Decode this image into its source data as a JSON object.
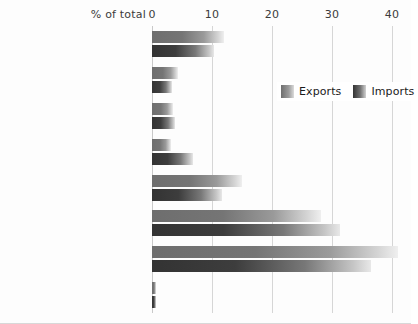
{
  "chart_data": {
    "type": "bar",
    "orientation": "horizontal",
    "title": "",
    "xlabel": "% of total",
    "ylabel": "",
    "xlim": [
      0,
      40
    ],
    "xticks": [
      0,
      10,
      20,
      30,
      40
    ],
    "xtick_labels": [
      "0",
      "10",
      "20",
      "30",
      "40"
    ],
    "grid": true,
    "legend_position": "upper right",
    "categories": [
      "Food/live animals",
      "Alcohol/tobacco",
      "Raw materials (ores etc.)",
      "Fuels/energy",
      "Chemicals",
      "Manufactured goods",
      "Machinery/transport equipment",
      "Other goods and services"
    ],
    "series": [
      {
        "name": "Exports",
        "color": "#6e6e6e",
        "values": [
          12.0,
          4.3,
          3.5,
          3.2,
          15.0,
          28.2,
          41.0,
          0.7
        ]
      },
      {
        "name": "Imports",
        "color": "#333333",
        "values": [
          10.4,
          3.3,
          3.8,
          6.8,
          11.6,
          31.4,
          36.5,
          0.7
        ]
      }
    ]
  },
  "axis": {
    "title": "% of total"
  },
  "legend": {
    "items": [
      {
        "label": "Exports"
      },
      {
        "label": "Imports"
      }
    ]
  }
}
